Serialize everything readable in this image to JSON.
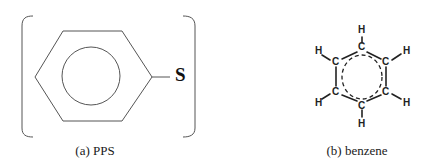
{
  "figure": {
    "panels": [
      {
        "id": "a",
        "caption": "(a) PPS",
        "structure": "polyphenylene sulfide repeat unit",
        "atom_labels": {
          "sulfur": "S"
        }
      },
      {
        "id": "b",
        "caption": "(b) benzene",
        "structure": "benzene with explicit C and H atoms",
        "atom_labels": {
          "carbon": "C",
          "hydrogen": "H",
          "carbons": [
            "C",
            "C",
            "C",
            "C",
            "C",
            "C"
          ],
          "hydrogens": [
            "H",
            "H",
            "H",
            "H",
            "H",
            "H"
          ]
        }
      }
    ],
    "colors": {
      "line": "#444444",
      "text": "#1a1a1a",
      "background": "#ffffff"
    }
  }
}
